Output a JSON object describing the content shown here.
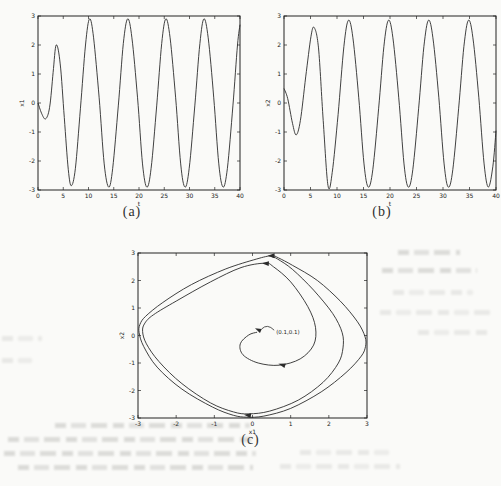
{
  "figure": {
    "colors": {
      "paper": "#fafaf8",
      "ink": "#2b2b2b",
      "axis": "#222222"
    }
  },
  "chart_data": [
    {
      "id": "a",
      "type": "line",
      "caption": "(a)",
      "xlabel": "t",
      "ylabel": "x1",
      "xlim": [
        0,
        40
      ],
      "ylim": [
        -3,
        3
      ],
      "xticks": [
        0,
        5,
        10,
        15,
        20,
        25,
        30,
        35,
        40
      ],
      "yticks": [
        -3,
        -2,
        -1,
        0,
        1,
        2,
        3
      ],
      "grid": false,
      "series": [
        {
          "name": "x1(t)",
          "points": [
            [
              0,
              0
            ],
            [
              0.7,
              -0.35
            ],
            [
              1.5,
              -0.55
            ],
            [
              2.3,
              -0.15
            ],
            [
              3.0,
              1.05
            ],
            [
              3.6,
              2.0
            ],
            [
              4.4,
              1.35
            ],
            [
              5.2,
              -0.5
            ],
            [
              6.0,
              -2.3
            ],
            [
              6.6,
              -2.85
            ],
            [
              7.4,
              -2.25
            ],
            [
              8.4,
              -0.2
            ],
            [
              9.4,
              2.0
            ],
            [
              10.2,
              2.9
            ],
            [
              11.0,
              2.25
            ],
            [
              12.1,
              0.2
            ],
            [
              13.1,
              -2.1
            ],
            [
              14.0,
              -2.9
            ],
            [
              14.8,
              -2.25
            ],
            [
              15.9,
              -0.1
            ],
            [
              16.9,
              2.05
            ],
            [
              17.75,
              2.9
            ],
            [
              18.6,
              2.25
            ],
            [
              19.7,
              0.2
            ],
            [
              20.7,
              -2.1
            ],
            [
              21.55,
              -2.9
            ],
            [
              22.4,
              -2.25
            ],
            [
              23.5,
              -0.1
            ],
            [
              24.5,
              2.05
            ],
            [
              25.3,
              2.9
            ],
            [
              26.15,
              2.25
            ],
            [
              27.25,
              0.2
            ],
            [
              28.25,
              -2.1
            ],
            [
              29.1,
              -2.9
            ],
            [
              29.95,
              -2.25
            ],
            [
              31.05,
              -0.1
            ],
            [
              32.05,
              2.05
            ],
            [
              32.85,
              2.9
            ],
            [
              33.7,
              2.25
            ],
            [
              34.8,
              0.2
            ],
            [
              35.8,
              -2.1
            ],
            [
              36.65,
              -2.9
            ],
            [
              37.5,
              -2.25
            ],
            [
              38.6,
              -0.1
            ],
            [
              39.5,
              2.0
            ],
            [
              40,
              2.7
            ]
          ]
        }
      ]
    },
    {
      "id": "b",
      "type": "line",
      "caption": "(b)",
      "xlabel": "t",
      "ylabel": "x2",
      "xlim": [
        0,
        40
      ],
      "ylim": [
        -3,
        3
      ],
      "xticks": [
        0,
        5,
        10,
        15,
        20,
        25,
        30,
        35,
        40
      ],
      "yticks": [
        -3,
        -2,
        -1,
        0,
        1,
        2,
        3
      ],
      "grid": false,
      "series": [
        {
          "name": "x2(t)",
          "points": [
            [
              0,
              0.5
            ],
            [
              0.7,
              0.15
            ],
            [
              1.6,
              -0.7
            ],
            [
              2.3,
              -1.1
            ],
            [
              3.1,
              -0.6
            ],
            [
              4.1,
              0.9
            ],
            [
              5.1,
              2.3
            ],
            [
              5.7,
              2.6
            ],
            [
              6.5,
              1.9
            ],
            [
              7.4,
              -0.6
            ],
            [
              8.3,
              -2.85
            ],
            [
              9.1,
              -2.4
            ],
            [
              10.2,
              -0.4
            ],
            [
              11.3,
              1.95
            ],
            [
              12.15,
              2.85
            ],
            [
              13.0,
              2.25
            ],
            [
              14.1,
              0.2
            ],
            [
              15.1,
              -2.1
            ],
            [
              15.9,
              -2.9
            ],
            [
              16.75,
              -2.3
            ],
            [
              17.85,
              -0.2
            ],
            [
              18.85,
              1.95
            ],
            [
              19.7,
              2.85
            ],
            [
              20.55,
              2.25
            ],
            [
              21.65,
              0.2
            ],
            [
              22.65,
              -2.1
            ],
            [
              23.45,
              -2.9
            ],
            [
              24.3,
              -2.3
            ],
            [
              25.4,
              -0.2
            ],
            [
              26.4,
              1.95
            ],
            [
              27.25,
              2.85
            ],
            [
              28.1,
              2.25
            ],
            [
              29.2,
              0.2
            ],
            [
              30.2,
              -2.1
            ],
            [
              31.0,
              -2.9
            ],
            [
              31.85,
              -2.3
            ],
            [
              32.95,
              -0.2
            ],
            [
              33.95,
              1.95
            ],
            [
              34.8,
              2.85
            ],
            [
              35.65,
              2.25
            ],
            [
              36.75,
              0.2
            ],
            [
              37.75,
              -2.1
            ],
            [
              38.55,
              -2.9
            ],
            [
              39.4,
              -2.2
            ],
            [
              40,
              -0.95
            ]
          ]
        }
      ]
    },
    {
      "id": "c",
      "type": "line",
      "caption": "(c)",
      "xlabel": "x1",
      "ylabel": "x2",
      "xlim": [
        -3,
        3
      ],
      "ylim": [
        -3,
        3
      ],
      "xticks": [
        -3,
        -2,
        -1,
        0,
        1,
        2,
        3
      ],
      "yticks": [
        -3,
        -2,
        -1,
        0,
        1,
        2,
        3
      ],
      "grid": false,
      "series": [
        {
          "name": "trajectory from (0.1,0.1)",
          "closed": false,
          "points": [
            [
              0.12,
              0.12
            ],
            [
              -0.1,
              0.02
            ],
            [
              -0.32,
              -0.3
            ],
            [
              -0.25,
              -0.7
            ],
            [
              0.15,
              -1.0
            ],
            [
              0.7,
              -1.08
            ],
            [
              1.25,
              -0.85
            ],
            [
              1.6,
              -0.35
            ],
            [
              1.65,
              0.3
            ],
            [
              1.45,
              1.05
            ],
            [
              1.0,
              1.95
            ],
            [
              0.55,
              2.5
            ],
            [
              0.32,
              2.63
            ],
            [
              -0.3,
              2.47
            ],
            [
              -1.1,
              1.95
            ],
            [
              -2.0,
              1.25
            ],
            [
              -2.6,
              0.75
            ],
            [
              -2.82,
              0.45
            ],
            [
              -2.88,
              0.15
            ],
            [
              -2.78,
              -0.3
            ],
            [
              -2.45,
              -0.95
            ],
            [
              -1.85,
              -1.75
            ],
            [
              -1.1,
              -2.45
            ],
            [
              -0.5,
              -2.78
            ],
            [
              -0.1,
              -2.85
            ],
            [
              0.45,
              -2.75
            ],
            [
              1.2,
              -2.35
            ],
            [
              1.85,
              -1.7
            ],
            [
              2.25,
              -1.0
            ],
            [
              2.37,
              -0.45
            ],
            [
              2.35,
              0.1
            ],
            [
              2.1,
              0.8
            ],
            [
              1.6,
              1.65
            ],
            [
              1.05,
              2.4
            ],
            [
              0.66,
              2.78
            ],
            [
              0.52,
              2.86
            ]
          ]
        },
        {
          "name": "limit cycle",
          "closed": true,
          "points": [
            [
              0.5,
              2.9
            ],
            [
              0.1,
              2.78
            ],
            [
              -0.7,
              2.42
            ],
            [
              -1.6,
              1.85
            ],
            [
              -2.35,
              1.2
            ],
            [
              -2.8,
              0.7
            ],
            [
              -2.95,
              0.4
            ],
            [
              -2.97,
              0.1
            ],
            [
              -2.85,
              -0.4
            ],
            [
              -2.5,
              -1.15
            ],
            [
              -1.85,
              -1.95
            ],
            [
              -1.05,
              -2.6
            ],
            [
              -0.5,
              -2.9
            ],
            [
              -0.15,
              -2.97
            ],
            [
              0.3,
              -2.93
            ],
            [
              1.0,
              -2.65
            ],
            [
              1.8,
              -2.05
            ],
            [
              2.45,
              -1.35
            ],
            [
              2.85,
              -0.75
            ],
            [
              2.96,
              -0.4
            ],
            [
              2.95,
              -0.05
            ],
            [
              2.75,
              0.5
            ],
            [
              2.3,
              1.25
            ],
            [
              1.7,
              2.0
            ],
            [
              1.05,
              2.55
            ],
            [
              0.68,
              2.82
            ]
          ]
        }
      ],
      "annotation": {
        "text": "(0.1,0.1)",
        "text_at": [
          0.62,
          0.12
        ],
        "arrow_to": [
          0.16,
          0.2
        ]
      },
      "arrows": [
        {
          "at": [
            0.5,
            2.9
          ],
          "angle": 180
        },
        {
          "at": [
            0.35,
            2.62
          ],
          "angle": 184
        },
        {
          "at": [
            0.78,
            -1.07
          ],
          "angle": 196
        },
        {
          "at": [
            -0.12,
            -2.9
          ],
          "angle": 188
        }
      ]
    }
  ]
}
